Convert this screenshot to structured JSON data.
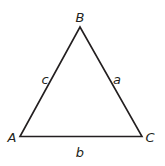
{
  "diagram": {
    "type": "triangle",
    "line_color": "#231f20",
    "vertices": {
      "A": {
        "label": "A",
        "x": 20,
        "y": 136
      },
      "B": {
        "label": "B",
        "x": 80,
        "y": 27
      },
      "C": {
        "label": "C",
        "x": 142,
        "y": 136
      }
    },
    "sides": {
      "a": {
        "label": "a",
        "between": [
          "B",
          "C"
        ]
      },
      "b": {
        "label": "b",
        "between": [
          "A",
          "C"
        ]
      },
      "c": {
        "label": "c",
        "between": [
          "A",
          "B"
        ]
      }
    }
  }
}
